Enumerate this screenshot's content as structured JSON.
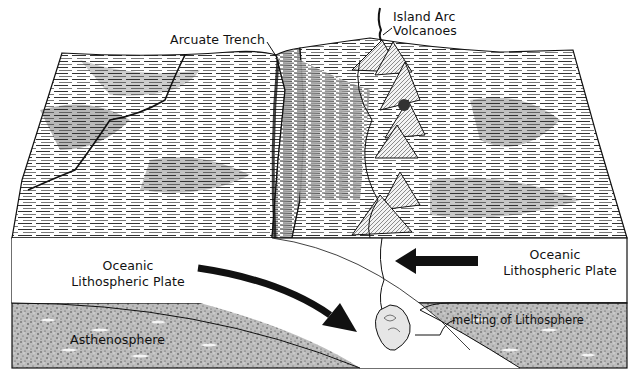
{
  "diagram": {
    "type": "block-diagram",
    "colors": {
      "ink": "#111111",
      "paper": "#ffffff",
      "hatch_dark": "#2a2a2a",
      "hatch_light": "#bdbdbd",
      "asthenosphere": "#8c8c8c"
    },
    "labels": {
      "trench": "Arcuate Trench",
      "volcanoes_line1": "Island Arc",
      "volcanoes_line2": "Volcanoes",
      "left_plate_line1": "Oceanic",
      "left_plate_line2": "Lithospheric Plate",
      "right_plate_line1": "Oceanic",
      "right_plate_line2": "Lithospheric Plate",
      "asthenosphere": "Asthenosphere",
      "melting": "melting of Lithosphere"
    },
    "arrows": [
      {
        "id": "subducting-plate-arrow",
        "direction": "down-right",
        "meaning": "left plate descends beneath right plate"
      },
      {
        "id": "overriding-plate-arrow",
        "direction": "left",
        "meaning": "right plate moves toward trench"
      }
    ],
    "features": [
      "arcuate trench",
      "chain of island arc volcanoes",
      "subducting slab",
      "magma conduit",
      "melting zone",
      "asthenosphere"
    ]
  }
}
